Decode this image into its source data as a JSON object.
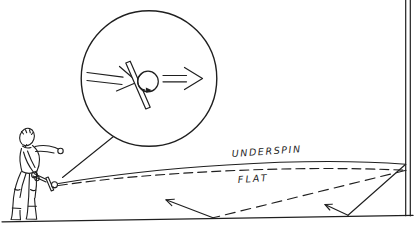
{
  "colors": {
    "ink": "#1f1f1f",
    "paper": "#ffffff"
  },
  "diagram": {
    "labels": {
      "underspin": "UNDERSPIN",
      "flat": "FLAT"
    },
    "icons": {
      "magnifier_inset": "magnified-impact-view",
      "incoming_arrow": "approach-direction-arrow",
      "outgoing_arrow": "exit-direction-arrow",
      "spin_arrow": "backspin-rotation-arrow",
      "underspin_bounce_arrow": "underspin-floor-rebound-arrow",
      "flat_bounce_arrow": "flat-floor-rebound-arrow"
    }
  }
}
